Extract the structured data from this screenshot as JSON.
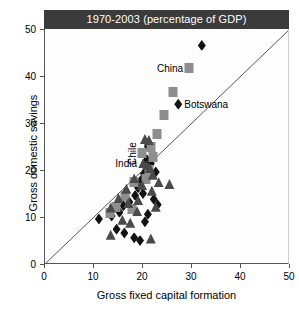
{
  "chart_data": {
    "type": "scatter",
    "title": "1970-2003 (percentage of GDP)",
    "xlabel": "Gross fixed capital formation",
    "ylabel": "Gross domestic savings",
    "xlim": [
      0,
      50
    ],
    "ylim": [
      0,
      50
    ],
    "xticks": [
      0,
      10,
      20,
      30,
      40,
      50
    ],
    "yticks": [
      0,
      10,
      20,
      30,
      40,
      50
    ],
    "grid": false,
    "legend": null,
    "reference_line": {
      "name": "45-degree-line",
      "from": [
        0,
        0
      ],
      "to": [
        50,
        50
      ],
      "description": "y = x identity line"
    },
    "series": [
      {
        "name": "diamond-series",
        "marker": "diamond",
        "color": "#121212",
        "points": [
          {
            "x": 32.0,
            "y": 46.5
          },
          {
            "x": 27.2,
            "y": 34.0,
            "label": "Botswana"
          },
          {
            "x": 21.0,
            "y": 25.0
          },
          {
            "x": 20.8,
            "y": 22.2
          },
          {
            "x": 20.6,
            "y": 20.6
          },
          {
            "x": 20.2,
            "y": 19.2
          },
          {
            "x": 19.6,
            "y": 17.8
          },
          {
            "x": 19.0,
            "y": 16.2
          },
          {
            "x": 18.4,
            "y": 14.6
          },
          {
            "x": 17.2,
            "y": 13.2
          },
          {
            "x": 16.0,
            "y": 12.4
          },
          {
            "x": 15.2,
            "y": 11.0
          },
          {
            "x": 13.6,
            "y": 10.2
          },
          {
            "x": 11.0,
            "y": 9.6
          },
          {
            "x": 20.0,
            "y": 15.0
          },
          {
            "x": 21.6,
            "y": 21.4
          },
          {
            "x": 22.2,
            "y": 13.8
          },
          {
            "x": 23.0,
            "y": 12.6
          },
          {
            "x": 14.6,
            "y": 7.4
          },
          {
            "x": 16.2,
            "y": 6.6
          },
          {
            "x": 18.2,
            "y": 5.6
          },
          {
            "x": 19.4,
            "y": 5.0
          },
          {
            "x": 21.0,
            "y": 10.6
          },
          {
            "x": 20.4,
            "y": 9.0
          },
          {
            "x": 22.6,
            "y": 19.6
          }
        ]
      },
      {
        "name": "square-series",
        "marker": "square",
        "color": "#8e8e8e",
        "points": [
          {
            "x": 29.4,
            "y": 41.8,
            "label": "China"
          },
          {
            "x": 26.2,
            "y": 36.6
          },
          {
            "x": 24.2,
            "y": 31.8
          },
          {
            "x": 22.8,
            "y": 27.6
          },
          {
            "x": 21.6,
            "y": 25.0
          },
          {
            "x": 19.8,
            "y": 23.6
          },
          {
            "x": 21.2,
            "y": 20.0
          },
          {
            "x": 18.2,
            "y": 17.4
          },
          {
            "x": 16.4,
            "y": 14.4
          },
          {
            "x": 14.4,
            "y": 12.2
          },
          {
            "x": 13.2,
            "y": 10.8
          },
          {
            "x": 17.8,
            "y": 11.6
          },
          {
            "x": 20.6,
            "y": 18.0
          },
          {
            "x": 22.0,
            "y": 22.8
          }
        ]
      },
      {
        "name": "triangle-series",
        "marker": "triangle",
        "color": "#4a4a4a",
        "points": [
          {
            "x": 20.4,
            "y": 26.6
          },
          {
            "x": 21.2,
            "y": 26.4
          },
          {
            "x": 20.0,
            "y": 21.4,
            "label": "India"
          },
          {
            "x": 20.8,
            "y": 21.0
          },
          {
            "x": 21.4,
            "y": 20.4
          },
          {
            "x": 22.0,
            "y": 19.0
          },
          {
            "x": 23.2,
            "y": 17.4
          },
          {
            "x": 25.4,
            "y": 17.0
          },
          {
            "x": 21.8,
            "y": 15.6
          },
          {
            "x": 19.8,
            "y": 16.8
          },
          {
            "x": 18.2,
            "y": 18.2
          },
          {
            "x": 16.6,
            "y": 16.0
          },
          {
            "x": 15.0,
            "y": 14.0
          },
          {
            "x": 13.4,
            "y": 12.0
          },
          {
            "x": 17.0,
            "y": 13.0
          },
          {
            "x": 19.0,
            "y": 13.6
          },
          {
            "x": 22.6,
            "y": 12.2
          },
          {
            "x": 15.8,
            "y": 9.4
          },
          {
            "x": 17.4,
            "y": 8.8
          },
          {
            "x": 13.4,
            "y": 6.2
          },
          {
            "x": 21.6,
            "y": 5.4
          },
          {
            "x": 18.8,
            "y": 11.2
          }
        ]
      }
    ],
    "annotations": [
      {
        "text": "China",
        "anchor": [
          29.4,
          41.8
        ],
        "placement": "left",
        "rotation": 0
      },
      {
        "text": "Botswana",
        "anchor": [
          27.2,
          34.0
        ],
        "placement": "right",
        "rotation": 0
      },
      {
        "text": "India",
        "anchor": [
          20.0,
          21.4
        ],
        "placement": "left",
        "rotation": 0
      },
      {
        "text": "Chile",
        "anchor": [
          20.8,
          22.2
        ],
        "placement": "above",
        "rotation": -90
      }
    ]
  }
}
